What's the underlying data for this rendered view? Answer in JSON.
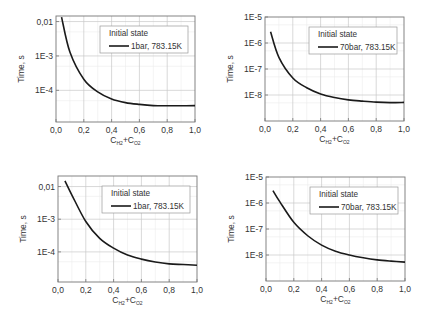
{
  "chart_data": [
    {
      "type": "line",
      "position": "top-left",
      "title": "",
      "xlabel": "C_H2+C_O2",
      "xlabel_main": [
        "C",
        "+C"
      ],
      "xlabel_subs": [
        "H2",
        "O2"
      ],
      "ylabel": "Time, s",
      "yscale": "log",
      "xlim": [
        0.0,
        1.0
      ],
      "ylim": [
        1.2e-05,
        0.0145
      ],
      "x_ticks": [
        "0,0",
        "0,2",
        "0,4",
        "0,6",
        "0,8",
        "1,0"
      ],
      "y_ticks": [
        {
          "value": 0.01,
          "label": "0,01"
        },
        {
          "value": 0.001,
          "label": "1E-3"
        },
        {
          "value": 0.0001,
          "label": "1E-4"
        }
      ],
      "grid": true,
      "legend": {
        "title": "Initial state",
        "entries": [
          "1bar, 783.15K"
        ],
        "position": "upper right"
      },
      "box": {
        "x0": 56,
        "y0": 16,
        "x1": 195,
        "y1": 122
      },
      "series": [
        {
          "name": "1bar, 783.15K",
          "x": [
            0.04,
            0.1,
            0.2,
            0.3,
            0.4,
            0.5,
            0.6,
            0.7,
            0.8,
            0.9,
            1.0
          ],
          "values": [
            0.0135,
            0.0013,
            0.00021,
            9e-05,
            5.6e-05,
            4.4e-05,
            3.9e-05,
            3.6e-05,
            3.55e-05,
            3.55e-05,
            3.6e-05
          ]
        }
      ]
    },
    {
      "type": "line",
      "position": "top-right",
      "title": "",
      "xlabel": "C_H2+C_O2",
      "xlabel_main": [
        "C",
        "+C"
      ],
      "xlabel_subs": [
        "H2",
        "O2"
      ],
      "ylabel": "Time, s",
      "yscale": "log",
      "xlim": [
        0.0,
        1.0
      ],
      "ylim": [
        1e-09,
        1e-05
      ],
      "x_ticks": [
        "0,0",
        "0,2",
        "0,4",
        "0,6",
        "0,8",
        "1,0"
      ],
      "y_ticks": [
        {
          "value": 1e-05,
          "label": "1E-5"
        },
        {
          "value": 1e-06,
          "label": "1E-6"
        },
        {
          "value": 1e-07,
          "label": "1E-7"
        },
        {
          "value": 1e-08,
          "label": "1E-8"
        }
      ],
      "grid": true,
      "legend": {
        "title": "Initial state",
        "entries": [
          "70bar, 783.15K"
        ],
        "position": "upper right"
      },
      "box": {
        "x0": 265,
        "y0": 17,
        "x1": 404,
        "y1": 121
      },
      "series": [
        {
          "name": "70bar, 783.15K",
          "x": [
            0.04,
            0.1,
            0.2,
            0.3,
            0.4,
            0.5,
            0.6,
            0.7,
            0.8,
            0.9,
            1.0
          ],
          "values": [
            2.7e-06,
            2.8e-07,
            4.5e-08,
            1.9e-08,
            1.1e-08,
            8e-09,
            6.5e-09,
            5.8e-09,
            5.3e-09,
            5.1e-09,
            5.2e-09
          ]
        }
      ]
    },
    {
      "type": "line",
      "position": "bottom-left",
      "title": "",
      "xlabel": "C_H2+C_O2",
      "xlabel_main": [
        "C",
        "+C"
      ],
      "xlabel_subs": [
        "H2",
        "O2"
      ],
      "ylabel": "Time, s",
      "yscale": "log",
      "xlim": [
        0.0,
        1.0
      ],
      "ylim": [
        1.2e-05,
        0.021
      ],
      "x_ticks": [
        "0,0",
        "0,2",
        "0,4",
        "0,6",
        "0,8",
        "1,0"
      ],
      "y_ticks": [
        {
          "value": 0.01,
          "label": "0,01"
        },
        {
          "value": 0.001,
          "label": "1E-3"
        },
        {
          "value": 0.0001,
          "label": "1E-4"
        }
      ],
      "grid": true,
      "legend": {
        "title": "Initial state",
        "entries": [
          "1bar, 783.15K"
        ],
        "position": "upper right"
      },
      "box": {
        "x0": 58,
        "y0": 176,
        "x1": 197,
        "y1": 282
      },
      "series": [
        {
          "name": "1bar, 783.15K",
          "x": [
            0.05,
            0.1,
            0.2,
            0.3,
            0.4,
            0.5,
            0.6,
            0.7,
            0.8,
            0.9,
            1.0
          ],
          "values": [
            0.015,
            0.0055,
            0.00085,
            0.00026,
            0.00013,
            8e-05,
            6e-05,
            4.9e-05,
            4.3e-05,
            4.1e-05,
            3.9e-05
          ]
        }
      ]
    },
    {
      "type": "line",
      "position": "bottom-right",
      "title": "",
      "xlabel": "C_H2+C_O2",
      "xlabel_main": [
        "C",
        "+C"
      ],
      "xlabel_subs": [
        "H2",
        "O2"
      ],
      "ylabel": "Time, s",
      "yscale": "log",
      "xlim": [
        0.0,
        1.0
      ],
      "ylim": [
        1e-09,
        1e-05
      ],
      "x_ticks": [
        "0,0",
        "0,2",
        "0,4",
        "0,6",
        "0,8",
        "1,0"
      ],
      "y_ticks": [
        {
          "value": 1e-05,
          "label": "1E-5"
        },
        {
          "value": 1e-06,
          "label": "1E-6"
        },
        {
          "value": 1e-07,
          "label": "1E-7"
        },
        {
          "value": 1e-08,
          "label": "1E-8"
        }
      ],
      "grid": true,
      "legend": {
        "title": "Initial state",
        "entries": [
          "70bar, 783.15K"
        ],
        "position": "upper right"
      },
      "box": {
        "x0": 266,
        "y0": 177,
        "x1": 405,
        "y1": 281
      },
      "series": [
        {
          "name": "70bar, 783.15K",
          "x": [
            0.05,
            0.1,
            0.2,
            0.3,
            0.4,
            0.5,
            0.6,
            0.7,
            0.8,
            0.9,
            1.0
          ],
          "values": [
            3e-06,
            1.1e-06,
            1.8e-07,
            5.5e-08,
            2.4e-08,
            1.4e-08,
            1e-08,
            7.8e-09,
            6.5e-09,
            5.8e-09,
            5.3e-09
          ]
        }
      ]
    }
  ],
  "colors": {
    "line": "#1a1a1a",
    "axis": "#777777",
    "grid_major": "#c8c8c8",
    "grid_minor": "#ececec",
    "text": "#333333",
    "legend_border": "#999999"
  }
}
